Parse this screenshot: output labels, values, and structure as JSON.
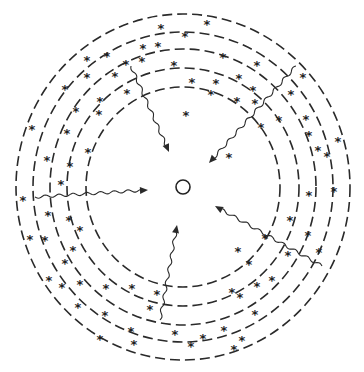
{
  "diagram": {
    "center": {
      "x": 183,
      "y": 187,
      "r": 7
    },
    "rings": [
      {
        "rx": 167,
        "ry": 173
      },
      {
        "rx": 150,
        "ry": 155
      },
      {
        "rx": 133,
        "ry": 138
      },
      {
        "rx": 116,
        "ry": 119
      },
      {
        "rx": 97,
        "ry": 100
      }
    ],
    "star_symbol": "*",
    "stars": [
      [
        161,
        24
      ],
      [
        87,
        56
      ],
      [
        107,
        52
      ],
      [
        143,
        44
      ],
      [
        158,
        42
      ],
      [
        174,
        61
      ],
      [
        126,
        60
      ],
      [
        142,
        57
      ],
      [
        115,
        72
      ],
      [
        87,
        73
      ],
      [
        65,
        85
      ],
      [
        100,
        97
      ],
      [
        127,
        89
      ],
      [
        32,
        125
      ],
      [
        76,
        107
      ],
      [
        99,
        110
      ],
      [
        67,
        129
      ],
      [
        88,
        148
      ],
      [
        47,
        156
      ],
      [
        70,
        162
      ],
      [
        61,
        180
      ],
      [
        23,
        196
      ],
      [
        48,
        211
      ],
      [
        69,
        216
      ],
      [
        80,
        226
      ],
      [
        30,
        235
      ],
      [
        45,
        236
      ],
      [
        73,
        246
      ],
      [
        65,
        259
      ],
      [
        49,
        276
      ],
      [
        62,
        283
      ],
      [
        80,
        280
      ],
      [
        106,
        284
      ],
      [
        132,
        284
      ],
      [
        157,
        290
      ],
      [
        150,
        305
      ],
      [
        78,
        303
      ],
      [
        105,
        311
      ],
      [
        131,
        327
      ],
      [
        100,
        335
      ],
      [
        134,
        340
      ],
      [
        175,
        330
      ],
      [
        191,
        342
      ],
      [
        203,
        334
      ],
      [
        224,
        326
      ],
      [
        234,
        345
      ],
      [
        255,
        310
      ],
      [
        240,
        293
      ],
      [
        238,
        247
      ],
      [
        249,
        260
      ],
      [
        272,
        276
      ],
      [
        257,
        282
      ],
      [
        288,
        251
      ],
      [
        290,
        216
      ],
      [
        308,
        231
      ],
      [
        319,
        248
      ],
      [
        309,
        191
      ],
      [
        334,
        187
      ],
      [
        318,
        146
      ],
      [
        309,
        131
      ],
      [
        338,
        137
      ],
      [
        306,
        115
      ],
      [
        327,
        152
      ],
      [
        291,
        90
      ],
      [
        279,
        116
      ],
      [
        303,
        73
      ],
      [
        255,
        99
      ],
      [
        253,
        86
      ],
      [
        257,
        61
      ],
      [
        207,
        20
      ],
      [
        185,
        32
      ],
      [
        223,
        53
      ],
      [
        239,
        74
      ],
      [
        216,
        79
      ],
      [
        192,
        78
      ],
      [
        211,
        90
      ],
      [
        237,
        97
      ],
      [
        186,
        111
      ],
      [
        229,
        153
      ],
      [
        261,
        123
      ],
      [
        265,
        234
      ],
      [
        232,
        288
      ],
      [
        242,
        336
      ]
    ],
    "arrows": [
      {
        "from": [
          131,
          66
        ],
        "to": [
          169,
          152
        ]
      },
      {
        "from": [
          296,
          66
        ],
        "to": [
          209,
          163
        ]
      },
      {
        "from": [
          35,
          197
        ],
        "to": [
          148,
          190
        ]
      },
      {
        "from": [
          322,
          266
        ],
        "to": [
          215,
          206
        ]
      },
      {
        "from": [
          160,
          320
        ],
        "to": [
          177,
          225
        ]
      }
    ]
  }
}
